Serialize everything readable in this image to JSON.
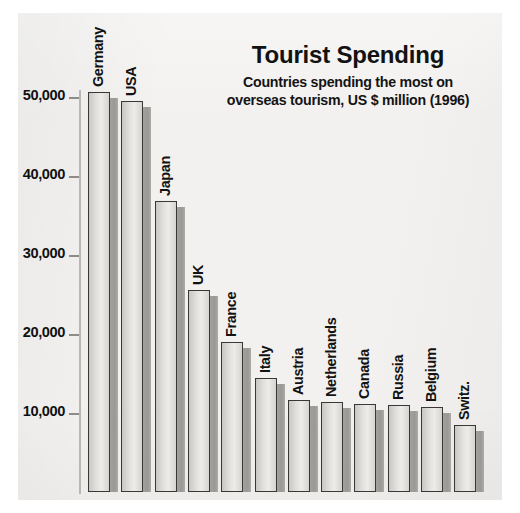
{
  "chart_data": {
    "type": "bar",
    "title": "Tourist Spending",
    "subtitle_line1": "Countries spending the most on",
    "subtitle_line2": "overseas tourism, US $ million (1996)",
    "xlabel": "",
    "ylabel": "",
    "ylim": [
      0,
      54000
    ],
    "grid": false,
    "legend": "none",
    "yticks": [
      10000,
      20000,
      30000,
      40000,
      50000
    ],
    "ytick_labels": [
      "10,000",
      "20,000",
      "30,000",
      "40,000",
      "50,000"
    ],
    "categories": [
      "Germany",
      "USA",
      "Japan",
      "UK",
      "France",
      "Italy",
      "Austria",
      "Netherlands",
      "Canada",
      "Russia",
      "Belgium",
      "Switz."
    ],
    "values": [
      50600,
      49500,
      36800,
      25600,
      19000,
      14400,
      11700,
      11400,
      11200,
      11000,
      10700,
      8500
    ],
    "units": "US $ million",
    "year": "1996",
    "colors": {
      "panel_background": "#f2f1ef",
      "page_background": "#ffffff",
      "bar_face": "#e3e1de",
      "bar_outline": "#3a3836",
      "bar_shadow": "#9b9996",
      "axis": "#b9b7b4",
      "text": "#121212"
    }
  }
}
